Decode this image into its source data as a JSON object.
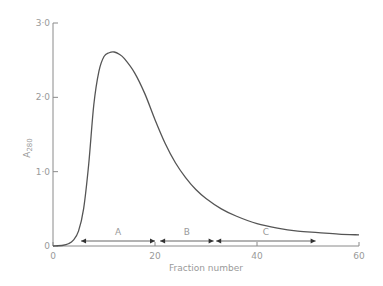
{
  "chart_data": {
    "type": "line",
    "title": "",
    "xlabel": "Fraction number",
    "ylabel": "A280",
    "ylabel_main": "A",
    "ylabel_sub": "280",
    "xlim": [
      0,
      60
    ],
    "ylim": [
      0,
      3.0
    ],
    "grid": false,
    "x_ticks": [
      0,
      20,
      40,
      60
    ],
    "x_tick_labels": [
      "0",
      "20",
      "40",
      "60"
    ],
    "y_ticks": [
      0,
      1.0,
      2.0,
      3.0
    ],
    "y_tick_labels": [
      "0",
      "1·0",
      "2·0",
      "3·0"
    ],
    "series": [
      {
        "name": "A280 elution profile",
        "x": [
          0,
          2,
          3,
          4,
          5,
          6,
          7,
          8,
          9,
          10,
          11,
          12,
          13,
          14,
          16,
          18,
          20,
          22,
          24,
          26,
          28,
          30,
          33,
          36,
          40,
          44,
          48,
          52,
          56,
          60
        ],
        "y": [
          0.0,
          0.01,
          0.03,
          0.08,
          0.2,
          0.5,
          1.1,
          1.9,
          2.35,
          2.55,
          2.6,
          2.61,
          2.58,
          2.52,
          2.33,
          2.05,
          1.7,
          1.38,
          1.12,
          0.92,
          0.76,
          0.64,
          0.5,
          0.4,
          0.3,
          0.24,
          0.2,
          0.18,
          0.16,
          0.15
        ]
      }
    ],
    "annotations": [
      {
        "label": "A",
        "x_start": 5.5,
        "x_end": 20
      },
      {
        "label": "B",
        "x_start": 21,
        "x_end": 31.5
      },
      {
        "label": "C",
        "x_start": 32,
        "x_end": 51.5
      }
    ]
  }
}
